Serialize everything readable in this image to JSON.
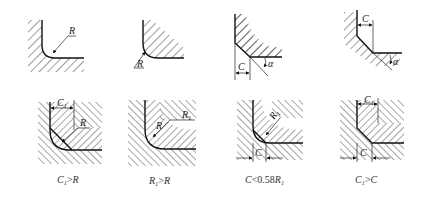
{
  "diagram": {
    "top_row": [
      {
        "id": "a",
        "type": "external-fillet",
        "label": "R"
      },
      {
        "id": "b",
        "type": "internal-fillet",
        "label": "R"
      },
      {
        "id": "c",
        "type": "external-chamfer",
        "labels": [
          "C",
          "α"
        ]
      },
      {
        "id": "d",
        "type": "internal-chamfer",
        "labels": [
          "C",
          "α"
        ]
      }
    ],
    "bottom_row": [
      {
        "id": "e",
        "labels": [
          "C1",
          "R"
        ],
        "caption": {
          "a": "C",
          "a_sub": "1",
          "op": ">",
          "b": "R",
          "b_sub": ""
        }
      },
      {
        "id": "f",
        "labels": [
          "R",
          "R1"
        ],
        "caption": {
          "a": "R",
          "a_sub": "1",
          "op": ">",
          "b": "R",
          "b_sub": ""
        }
      },
      {
        "id": "g",
        "labels": [
          "R1",
          "C"
        ],
        "caption": {
          "a": "C",
          "a_sub": "",
          "op": "<0.58",
          "b": "R",
          "b_sub": "1"
        }
      },
      {
        "id": "h",
        "labels": [
          "C1",
          "C"
        ],
        "caption": {
          "a": "C",
          "a_sub": "1",
          "op": ">",
          "b": "C",
          "b_sub": ""
        }
      }
    ],
    "text": {
      "R": "R",
      "C": "C",
      "alpha": "α",
      "one": "1",
      "R1": "R",
      "C1": "C"
    }
  }
}
